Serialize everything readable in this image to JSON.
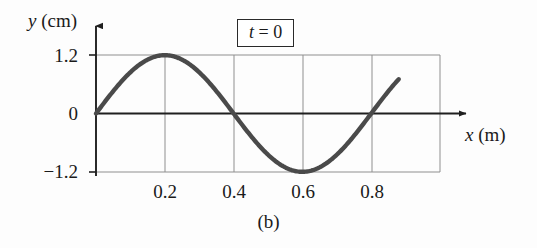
{
  "figure": {
    "caption": "(b)",
    "background_color": "#fdfdfd"
  },
  "annotations": {
    "time_badge": {
      "variable": "t",
      "equals": " = ",
      "value": "0",
      "full_text": "t = 0"
    }
  },
  "axes": {
    "y": {
      "variable": "y",
      "unit": "(cm)",
      "label": "y (cm)"
    },
    "x": {
      "variable": "x",
      "unit": "(m)",
      "label": "x (m)"
    }
  },
  "ticks": {
    "x_labels": [
      "0.2",
      "0.4",
      "0.6",
      "0.8"
    ],
    "y_labels": [
      "1.2",
      "0",
      "−1.2"
    ]
  },
  "colors": {
    "curve": "#4a4a4a",
    "grid": "#8f8f8f",
    "axis": "#1f1f1f",
    "text": "#1a1a1a"
  },
  "chart_data": {
    "type": "line",
    "title": "",
    "subtitle": "",
    "xlabel": "x (m)",
    "ylabel": "y (cm)",
    "xlim": [
      0,
      1.0
    ],
    "ylim": [
      -1.2,
      1.2
    ],
    "xticks": [
      0.2,
      0.4,
      0.6,
      0.8
    ],
    "yticks": [
      -1.2,
      0,
      1.2
    ],
    "grid": true,
    "legend": null,
    "annotations": [
      "t = 0",
      "(b)"
    ],
    "wave": {
      "amplitude_cm": 1.2,
      "wavelength_m": 0.8,
      "phase": 0,
      "equation": "y = 1.2 sin(2πx / 0.8)",
      "x_start": 0.0,
      "x_end": 0.88
    },
    "series": [
      {
        "name": "y(x) at t = 0",
        "x": [
          0.0,
          0.02,
          0.04,
          0.06,
          0.08,
          0.1,
          0.12,
          0.14,
          0.16,
          0.18,
          0.2,
          0.22,
          0.24,
          0.26,
          0.28,
          0.3,
          0.32,
          0.34,
          0.36,
          0.38,
          0.4,
          0.42,
          0.44,
          0.46,
          0.48,
          0.5,
          0.52,
          0.54,
          0.56,
          0.58,
          0.6,
          0.62,
          0.64,
          0.66,
          0.68,
          0.7,
          0.72,
          0.74,
          0.76,
          0.78,
          0.8,
          0.82,
          0.84,
          0.86,
          0.88
        ],
        "y": [
          0.0,
          0.187,
          0.367,
          0.534,
          0.682,
          0.808,
          0.906,
          0.974,
          1.011,
          1.015,
          0.986,
          0.926,
          0.837,
          0.721,
          0.583,
          0.427,
          0.259,
          0.085,
          -0.091,
          -0.264,
          -0.43,
          -0.585,
          -0.722,
          -0.838,
          -0.927,
          -0.987,
          -1.016,
          -1.012,
          -0.975,
          -0.907,
          -1.2,
          -0.683,
          -0.535,
          -0.368,
          -0.188,
          0.0,
          0.188,
          0.368,
          0.535,
          0.683,
          0.0,
          0.368,
          0.683,
          0.906,
          0.85
        ]
      }
    ],
    "key_points": [
      {
        "x": 0.0,
        "y": 0.0,
        "note": "zero crossing, rising"
      },
      {
        "x": 0.2,
        "y": 1.2,
        "note": "crest"
      },
      {
        "x": 0.4,
        "y": 0.0,
        "note": "zero crossing, falling"
      },
      {
        "x": 0.6,
        "y": -1.2,
        "note": "trough"
      },
      {
        "x": 0.8,
        "y": 0.0,
        "note": "zero crossing, rising"
      },
      {
        "x": 0.88,
        "y": 0.85,
        "note": "curve end"
      }
    ]
  }
}
